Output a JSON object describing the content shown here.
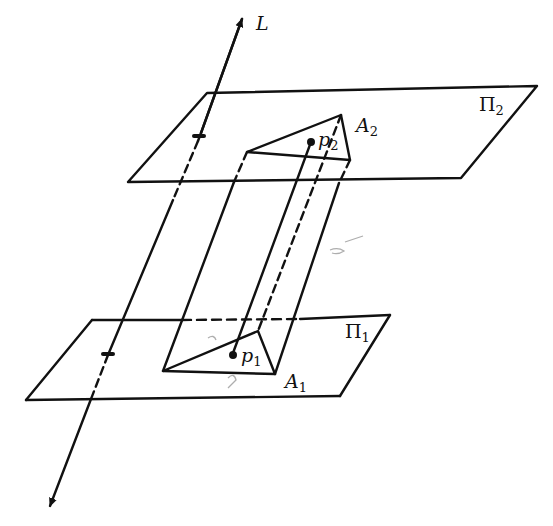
{
  "figure": {
    "type": "geometry-diagram",
    "stroke_color": "#111111",
    "background": "#ffffff"
  },
  "labels": {
    "line_L": "L",
    "plane_1": {
      "base": "Π",
      "sub": "1"
    },
    "plane_2": {
      "base": "Π",
      "sub": "2"
    },
    "region_1": {
      "base": "A",
      "sub": "1"
    },
    "region_2": {
      "base": "A",
      "sub": "2"
    },
    "point_1": {
      "base": "p",
      "sub": "1"
    },
    "point_2": {
      "base": "p",
      "sub": "2"
    }
  }
}
